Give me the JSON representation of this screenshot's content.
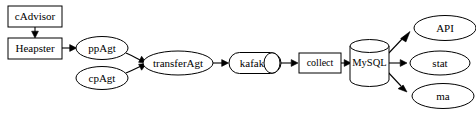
{
  "diagram": {
    "type": "flowchart",
    "background_color": "#ffffff",
    "stroke_color": "#000000",
    "fill_color": "#ffffff",
    "nodes": [
      {
        "id": "cadvisor",
        "label": "cAdvisor",
        "shape": "box",
        "cx": 35,
        "cy": 16,
        "w": 54,
        "h": 21
      },
      {
        "id": "heapster",
        "label": "Heapster",
        "shape": "box",
        "cx": 35,
        "cy": 48,
        "w": 54,
        "h": 21
      },
      {
        "id": "ppagt",
        "label": "ppAgt",
        "shape": "ellipse",
        "cx": 102,
        "cy": 48,
        "w": 52,
        "h": 23
      },
      {
        "id": "cpagt",
        "label": "cpAgt",
        "shape": "ellipse",
        "cx": 102,
        "cy": 78,
        "w": 52,
        "h": 23
      },
      {
        "id": "transferagt",
        "label": "transferAgt",
        "shape": "ellipse",
        "cx": 178,
        "cy": 63,
        "w": 70,
        "h": 24
      },
      {
        "id": "kafak",
        "label": "kafak",
        "shape": "cylinder",
        "cx": 255,
        "cy": 63,
        "w": 52,
        "h": 21
      },
      {
        "id": "collect",
        "label": "collect",
        "shape": "box",
        "cx": 320,
        "cy": 63,
        "w": 42,
        "h": 20
      },
      {
        "id": "mysql",
        "label": "MySQL",
        "shape": "database",
        "cx": 369,
        "cy": 63,
        "w": 39,
        "h": 45
      },
      {
        "id": "api",
        "label": "API",
        "shape": "ellipse",
        "cx": 445,
        "cy": 28,
        "w": 62,
        "h": 25
      },
      {
        "id": "stat",
        "label": "stat",
        "shape": "ellipse",
        "cx": 440,
        "cy": 63,
        "w": 60,
        "h": 24
      },
      {
        "id": "ma",
        "label": "ma",
        "shape": "ellipse",
        "cx": 443,
        "cy": 96,
        "w": 62,
        "h": 25
      }
    ],
    "edges": [
      {
        "id": "e1",
        "from": "cadvisor",
        "to": "heapster",
        "label": "",
        "direction": "down"
      },
      {
        "id": "e2",
        "from": "heapster",
        "to": "ppagt",
        "label": "",
        "direction": "right"
      },
      {
        "id": "e3",
        "from": "ppagt",
        "to": "transferagt",
        "label": "",
        "direction": "right-down"
      },
      {
        "id": "e4",
        "from": "cpagt",
        "to": "transferagt",
        "label": "",
        "direction": "right-up"
      },
      {
        "id": "e5",
        "from": "transferagt",
        "to": "kafak",
        "label": "",
        "direction": "right"
      },
      {
        "id": "e6",
        "from": "kafak",
        "to": "collect",
        "label": "",
        "direction": "right"
      },
      {
        "id": "e7",
        "from": "collect",
        "to": "mysql",
        "label": "",
        "direction": "right"
      },
      {
        "id": "e8",
        "from": "mysql",
        "to": "api",
        "label": "",
        "direction": "right-up"
      },
      {
        "id": "e9",
        "from": "mysql",
        "to": "stat",
        "label": "",
        "direction": "right"
      },
      {
        "id": "e10",
        "from": "mysql",
        "to": "ma",
        "label": "",
        "direction": "right-down"
      }
    ]
  }
}
